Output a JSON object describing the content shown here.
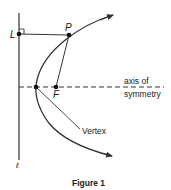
{
  "figure": {
    "caption": "Figure 1",
    "labels": {
      "point_p": "P",
      "point_l": "L",
      "point_f": "F",
      "directrix": "ℓ",
      "axis_line1": "axis of",
      "axis_line2": "symmetry",
      "vertex": "Vertex"
    },
    "colors": {
      "stroke": "#333333",
      "text": "#222222",
      "background": "#ffffff"
    }
  }
}
